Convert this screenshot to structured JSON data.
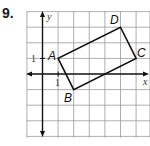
{
  "problem": {
    "number": "9."
  },
  "graph": {
    "grid": {
      "x_min": -1,
      "x_max": 7,
      "y_min": -4,
      "y_max": 4,
      "unit_px": 15.6,
      "origin_px": [
        42.5,
        74
      ],
      "line_color": "#9a9a9a"
    },
    "axes": {
      "x_label": "x",
      "y_label": "y",
      "x_tick_label": "1",
      "y_tick_label": "1"
    },
    "polygon": {
      "name": "rectangle ABCD",
      "vertices": [
        {
          "label": "A",
          "x": 1,
          "y": 1
        },
        {
          "label": "B",
          "x": 2,
          "y": -1
        },
        {
          "label": "C",
          "x": 6,
          "y": 1
        },
        {
          "label": "D",
          "x": 5,
          "y": 3
        }
      ],
      "stroke_color": "#111111"
    }
  }
}
